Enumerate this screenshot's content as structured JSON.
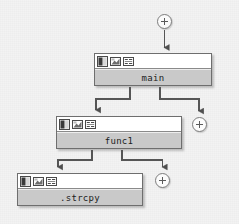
{
  "diagram": {
    "type": "call-graph",
    "background_color": "#f3f3f3",
    "edge_color": "#555555",
    "node_border_color": "#6e6e6e",
    "node_header_color": "#ffffff",
    "node_label_color": "#c9c9c9",
    "node_text_color": "#1c1c1c"
  },
  "nodes": [
    {
      "id": "plus-root",
      "kind": "expand-toggle",
      "label": "+",
      "x": 157,
      "y": 14,
      "width": 15,
      "height": 15
    },
    {
      "id": "main",
      "kind": "function",
      "label": "main",
      "x": 94,
      "y": 53,
      "width": 118,
      "height": 33,
      "icons": [
        "source-view-icon",
        "graph-view-icon",
        "disassembly-view-icon"
      ]
    },
    {
      "id": "plus-main",
      "kind": "expand-toggle",
      "label": "+",
      "x": 192,
      "y": 117,
      "width": 15,
      "height": 15
    },
    {
      "id": "func1",
      "kind": "function",
      "label": "func1",
      "x": 56,
      "y": 116,
      "width": 126,
      "height": 33,
      "icons": [
        "source-view-icon",
        "graph-view-icon",
        "disassembly-view-icon"
      ]
    },
    {
      "id": "plus-func1",
      "kind": "expand-toggle",
      "label": "+",
      "x": 155,
      "y": 173,
      "width": 15,
      "height": 15
    },
    {
      "id": "strcpy",
      "kind": "function",
      "label": ".strcpy",
      "x": 17,
      "y": 173,
      "width": 126,
      "height": 33,
      "icons": [
        "source-view-icon",
        "graph-view-icon",
        "disassembly-view-icon"
      ]
    }
  ],
  "edges": [
    {
      "id": "edge-root-main",
      "from": "plus-root",
      "to": "main",
      "arrow": true
    },
    {
      "id": "edge-main-func1",
      "from": "main",
      "to": "func1",
      "arrow": true
    },
    {
      "id": "edge-main-plus",
      "from": "main",
      "to": "plus-main",
      "arrow": true
    },
    {
      "id": "edge-func1-strcpy",
      "from": "func1",
      "to": "strcpy",
      "arrow": true
    },
    {
      "id": "edge-func1-plus",
      "from": "func1",
      "to": "plus-func1",
      "arrow": true
    }
  ]
}
